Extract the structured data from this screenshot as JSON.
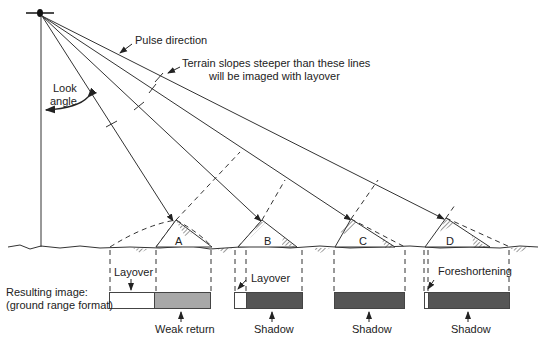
{
  "labels": {
    "pulse_direction": "Pulse direction",
    "terrain_note_line1": "Terrain slopes steeper than these lines",
    "terrain_note_line2": "will be imaged with layover",
    "look_angle_line1": "Look",
    "look_angle_line2": "angle",
    "resulting_image_line1": "Resulting image:",
    "resulting_image_line2": "(ground range format)"
  },
  "features": [
    {
      "id": "A",
      "label": "A",
      "top_label": "Layover",
      "bottom_label": "Weak return"
    },
    {
      "id": "B",
      "label": "B",
      "top_label": "Layover",
      "bottom_label": "Shadow"
    },
    {
      "id": "C",
      "label": "C",
      "top_label": "",
      "bottom_label": "Shadow"
    },
    {
      "id": "D",
      "label": "D",
      "top_label": "Foreshortening",
      "bottom_label": "Shadow"
    }
  ],
  "colors": {
    "line": "#333333",
    "bright": "#ffffff",
    "weak": "#a8a8a8",
    "shadow": "#555555"
  }
}
